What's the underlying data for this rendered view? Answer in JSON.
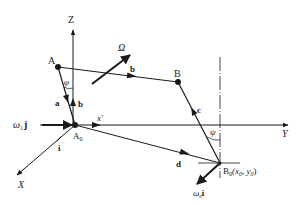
{
  "diagram": {
    "axes": {
      "z": "Z",
      "y": "Y",
      "x": "X",
      "x_prime": "x′"
    },
    "points": {
      "A": "A",
      "B": "B",
      "A0": "A",
      "A0_sub": "0",
      "B0": "B",
      "B0_sub": "0",
      "B0_coords": "(x",
      "B0_x_sub": "0",
      "B0_mid": ", y",
      "B0_y_sub": "0",
      "B0_end": ")"
    },
    "vectors": {
      "a": "a",
      "b_link": "b",
      "b_unit": "b",
      "c": "c",
      "d": "d",
      "i": "i"
    },
    "angles": {
      "phi": "φ",
      "psi": "ψ"
    },
    "rotation": {
      "omega_big": "Ω",
      "omega1": "ω",
      "omega1_sub": "1",
      "omega1_vec": "j",
      "omega0": "ω",
      "omega0_sub": "0",
      "omega0_vec": "i"
    },
    "colors": {
      "ink": "#1a1a1a",
      "background": "#ffffff"
    }
  }
}
